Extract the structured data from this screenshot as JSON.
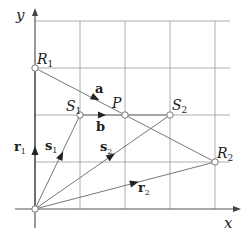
{
  "diagram": {
    "axes": {
      "x_label": "x",
      "y_label": "y"
    },
    "grid": {
      "columns": 4,
      "rows": 4
    },
    "points": {
      "R1": {
        "label": "R",
        "sub": "1",
        "grid": [
          0,
          3
        ]
      },
      "R2": {
        "label": "R",
        "sub": "2",
        "grid": [
          4,
          1
        ]
      },
      "S1": {
        "label": "S",
        "sub": "1",
        "grid": [
          1,
          2
        ]
      },
      "S2": {
        "label": "S",
        "sub": "2",
        "grid": [
          3,
          2
        ]
      },
      "P": {
        "label": "P",
        "sub": "",
        "grid": [
          2,
          2
        ]
      },
      "O": {
        "label": "",
        "sub": "",
        "grid": [
          0,
          0
        ]
      }
    },
    "vectors": {
      "r1": {
        "label": "r",
        "sub": "1",
        "from": "O",
        "to": "R1"
      },
      "r2": {
        "label": "r",
        "sub": "2",
        "from": "O",
        "to": "R2"
      },
      "s1": {
        "label": "s",
        "sub": "1",
        "from": "O",
        "to": "S1"
      },
      "s2": {
        "label": "s",
        "sub": "2",
        "from": "O",
        "to": "S2"
      },
      "a": {
        "label": "a",
        "sub": "",
        "from": "R1",
        "to": "R2"
      },
      "b": {
        "label": "b",
        "sub": "",
        "from": "S1",
        "to": "S2"
      }
    },
    "colors": {
      "grid": "#8a8a8a",
      "axis": "#555555",
      "line": "#666666",
      "arrow": "#222222",
      "point_fill": "#ffffff",
      "point_stroke": "#777777"
    }
  }
}
